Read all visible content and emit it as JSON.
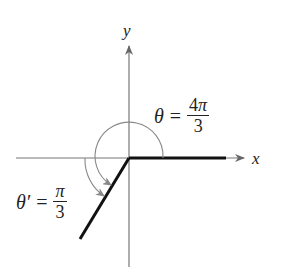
{
  "diagram": {
    "type": "angle-reference-diagram",
    "axes": {
      "x_label": "x",
      "y_label": "y"
    },
    "angle": {
      "symbol": "θ",
      "equals": "=",
      "numerator_coef": "4",
      "numerator_pi": "π",
      "denominator": "3",
      "value_text": "θ = 4π/3"
    },
    "reference_angle": {
      "symbol": "θ′",
      "equals": "=",
      "numerator_pi": "π",
      "denominator": "3",
      "value_text": "θ′ = π/3"
    },
    "colors": {
      "axis": "#777777",
      "terminal_side": "#111111",
      "arc": "#888888",
      "text": "#222222"
    }
  }
}
